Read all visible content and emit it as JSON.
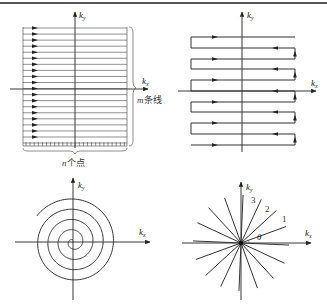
{
  "figure": {
    "panels": [
      {
        "id": "cartesian",
        "title": "Cartesian k-space sampling",
        "axis_x": {
          "label": "k",
          "sub": "x"
        },
        "axis_y": {
          "label": "k",
          "sub": "y"
        },
        "line_count_label": "m条线",
        "point_count_label": "n个点",
        "lines": 19
      },
      {
        "id": "raster",
        "title": "Zig-zag (EPI) trajectory",
        "axis_x": {
          "label": "k",
          "sub": "x"
        },
        "axis_y": {
          "label": "k",
          "sub": "y"
        }
      },
      {
        "id": "spiral",
        "title": "Spiral trajectory",
        "axis_x": {
          "label": "k",
          "sub": "x"
        },
        "axis_y": {
          "label": "k",
          "sub": "y"
        }
      },
      {
        "id": "radial",
        "title": "Radial trajectory",
        "axis_x": {
          "label": "k",
          "sub": "x"
        },
        "axis_y": {
          "label": "k",
          "sub": "y"
        },
        "spoke_labels": [
          "1",
          "2",
          "3"
        ],
        "angle_label": "θ",
        "spokes": 8
      }
    ],
    "colors": {
      "line": "#333333",
      "axis": "#222222",
      "rule": "#555555"
    }
  }
}
